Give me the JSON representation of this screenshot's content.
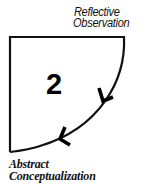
{
  "diagram": {
    "stage_number": "2",
    "top_label": {
      "line1": "Reflective",
      "line2": "Observation"
    },
    "bottom_label": {
      "line1": "Abstract",
      "line2": "Conceptualization"
    },
    "arrows": [
      {
        "name": "arrow-upper",
        "direction": "down-left"
      },
      {
        "name": "arrow-lower",
        "direction": "left"
      }
    ],
    "colors": {
      "stroke": "#111111",
      "background": "#ffffff",
      "text": "#111111"
    }
  }
}
